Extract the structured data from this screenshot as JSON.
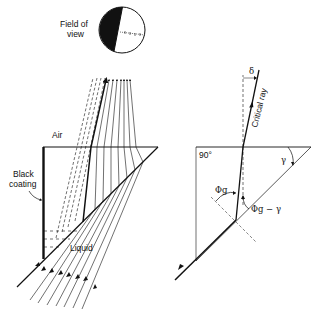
{
  "figure": {
    "field_of_view": {
      "label_line1": "Field of",
      "label_line2": "view"
    },
    "left_prism": {
      "air_label": "Air",
      "coating_label_line1": "Black",
      "coating_label_line2": "coating",
      "liquid_label": "Liquid"
    },
    "right_prism": {
      "right_angle_label": "90°",
      "critical_ray_label": "Critical ray",
      "delta_label": "δ",
      "gamma_label": "γ",
      "phi_g_label": "Φg",
      "phi_g_minus_gamma_label": "Φg − γ"
    },
    "colors": {
      "ink": "#111111",
      "background": "#ffffff"
    }
  }
}
